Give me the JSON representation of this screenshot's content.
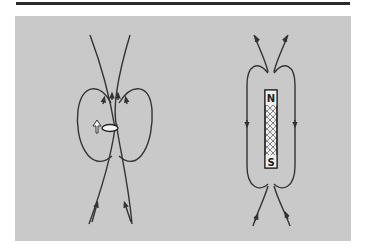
{
  "figure": {
    "background_color": "#c9c9c9",
    "line_color": "#333333",
    "left_diagram": {
      "subject": "current loop (magnetic dipole)",
      "moment_arrow": "up-arrow"
    },
    "right_diagram": {
      "subject": "bar magnet",
      "north_label": "N",
      "south_label": "S"
    }
  }
}
